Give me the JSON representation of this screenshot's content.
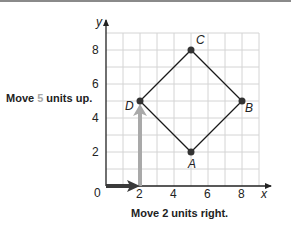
{
  "figure": {
    "captions": {
      "up": {
        "prefix": "Move ",
        "number": "5",
        "suffix": " units up."
      },
      "right": {
        "text": "Move 2 units right."
      }
    },
    "axes": {
      "x_label": "x",
      "y_label": "y",
      "origin_label": "0",
      "x_ticks": [
        "2",
        "4",
        "6",
        "8"
      ],
      "y_ticks": [
        "2",
        "4",
        "6",
        "8"
      ],
      "range": {
        "x": [
          0,
          9
        ],
        "y": [
          0,
          9
        ]
      },
      "grid": true
    },
    "points": [
      {
        "label": "A",
        "x": 5,
        "y": 2
      },
      {
        "label": "B",
        "x": 8,
        "y": 5
      },
      {
        "label": "C",
        "x": 5,
        "y": 8
      },
      {
        "label": "D",
        "x": 2,
        "y": 5
      }
    ],
    "translation_arrows": [
      {
        "name": "right",
        "from": [
          0,
          0
        ],
        "to": [
          2,
          0
        ],
        "color": "#3a3a3a"
      },
      {
        "name": "up",
        "from": [
          2,
          0
        ],
        "to": [
          2,
          5
        ],
        "color": "#a9a9a9"
      }
    ],
    "colors": {
      "grid": "#d4d4d4",
      "axis": "#222222",
      "shape": "#1a1a1a",
      "highlight_number": "#a8a8a8"
    }
  }
}
